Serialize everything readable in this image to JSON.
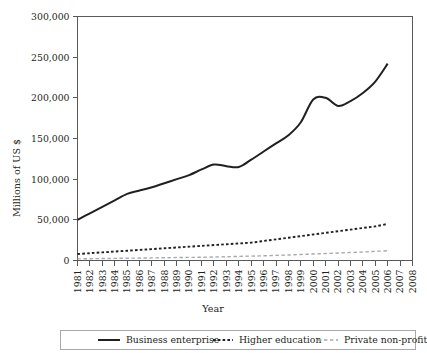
{
  "chart_data": {
    "type": "line",
    "title": "",
    "xlabel": "Year",
    "ylabel": "Millions of US $",
    "xlim": [
      1981,
      2008
    ],
    "ylim": [
      0,
      300000
    ],
    "yticks": [
      0,
      50000,
      100000,
      150000,
      200000,
      250000,
      300000
    ],
    "ytick_labels": [
      "0",
      "50,000",
      "100,000",
      "150,000",
      "200,000",
      "250,000",
      "300,000"
    ],
    "x": [
      1981,
      1982,
      1983,
      1984,
      1985,
      1986,
      1987,
      1988,
      1989,
      1990,
      1991,
      1992,
      1993,
      1994,
      1995,
      1996,
      1997,
      1998,
      1999,
      2000,
      2001,
      2002,
      2003,
      2004,
      2005,
      2006
    ],
    "xtick_labels": [
      "1981",
      "1982",
      "1983",
      "1984",
      "1985",
      "1986",
      "1987",
      "1988",
      "1989",
      "1990",
      "1991",
      "1992",
      "1993",
      "1994",
      "1995",
      "1996",
      "1997",
      "1998",
      "1999",
      "2000",
      "2001",
      "2002",
      "2003",
      "2004",
      "2005",
      "2006",
      "2007",
      "2008"
    ],
    "grid": false,
    "legend_position": "bottom",
    "series": [
      {
        "name": "Business enterprise",
        "style": "solid",
        "color": "#231f20",
        "values": [
          50000,
          58000,
          66000,
          74000,
          82000,
          86000,
          90000,
          95000,
          100000,
          105000,
          112000,
          118000,
          116000,
          115000,
          124000,
          134000,
          144000,
          154000,
          170000,
          198000,
          200000,
          190000,
          196000,
          206000,
          220000,
          242000
        ]
      },
      {
        "name": "Higher education",
        "style": "dashed",
        "color": "#231f20",
        "values": [
          8000,
          9000,
          10000,
          11000,
          12000,
          13000,
          14000,
          15000,
          16000,
          17000,
          18000,
          19000,
          20000,
          21000,
          22000,
          24000,
          26000,
          28000,
          30000,
          32000,
          34000,
          36000,
          38000,
          40000,
          42000,
          45000
        ]
      },
      {
        "name": "Private non-profit",
        "style": "dashed-light",
        "color": "#a7a9ac",
        "values": [
          2000,
          2200,
          2400,
          2600,
          2800,
          3000,
          3200,
          3400,
          3600,
          3800,
          4000,
          4300,
          4600,
          5000,
          5400,
          5800,
          6300,
          6800,
          7400,
          8000,
          8600,
          9200,
          9800,
          10500,
          11200,
          12000
        ]
      }
    ]
  },
  "legend": {
    "items": [
      {
        "label": "Business enterprise"
      },
      {
        "label": "Higher education"
      },
      {
        "label": "Private non-profit"
      }
    ]
  }
}
